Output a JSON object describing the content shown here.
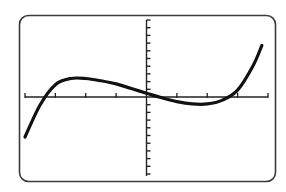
{
  "screen": {
    "frame_color": "#3a3a3a",
    "curve_color": "#111111",
    "axis_color": "#222222",
    "background": "#ffffff"
  },
  "chart_data": {
    "type": "line",
    "title": "",
    "xlabel": "",
    "ylabel": "",
    "xlim": [
      -4,
      4
    ],
    "ylim": [
      -10,
      10
    ],
    "x_ticks": [
      -4,
      -3,
      -2,
      -1,
      0,
      1,
      2,
      3,
      4
    ],
    "y_tick_step": 1,
    "grid": false,
    "legend": null,
    "series": [
      {
        "name": "f(x)",
        "x": [
          -4.0,
          -3.5,
          -3.0,
          -2.5,
          -2.0,
          -1.5,
          -1.0,
          -0.5,
          0.0,
          0.5,
          1.0,
          1.5,
          2.0,
          2.5,
          3.0,
          3.5,
          3.8
        ],
        "values": [
          -5.2,
          -1.0,
          1.6,
          2.4,
          2.4,
          2.1,
          1.7,
          1.1,
          0.5,
          -0.1,
          -0.6,
          -0.9,
          -0.9,
          -0.4,
          0.9,
          4.0,
          6.7
        ]
      }
    ]
  }
}
